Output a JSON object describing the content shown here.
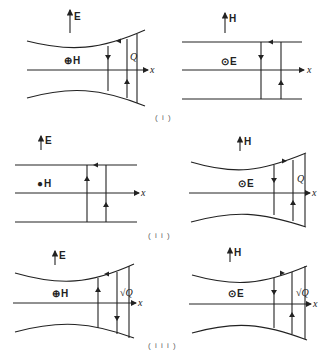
{
  "rows": [
    {
      "caption": "( i )",
      "left": {
        "field_up": "E",
        "field_normal": "H",
        "normal_symbol": "⊕",
        "waveguide": "flared",
        "q_label": "Q",
        "axis_label": "x"
      },
      "right": {
        "field_up": "H",
        "field_normal": "E",
        "normal_symbol": "⊙",
        "waveguide": "parallel",
        "q_label": "",
        "axis_label": "x"
      }
    },
    {
      "caption": "( i i )",
      "left": {
        "field_up": "E",
        "field_normal": "H",
        "normal_symbol": "●",
        "waveguide": "parallel",
        "q_label": "",
        "axis_label": "x"
      },
      "right": {
        "field_up": "H",
        "field_normal": "E",
        "normal_symbol": "⊙",
        "waveguide": "flared",
        "q_label": "Q",
        "axis_label": "x"
      }
    },
    {
      "caption": "( i i i )",
      "left": {
        "field_up": "E",
        "field_normal": "H",
        "normal_symbol": "⊕",
        "waveguide": "flared",
        "q_label": "√Q",
        "axis_label": "x"
      },
      "right": {
        "field_up": "H",
        "field_normal": "E",
        "normal_symbol": "⊙",
        "waveguide": "flared",
        "q_label": "√Q",
        "axis_label": "x"
      }
    }
  ]
}
